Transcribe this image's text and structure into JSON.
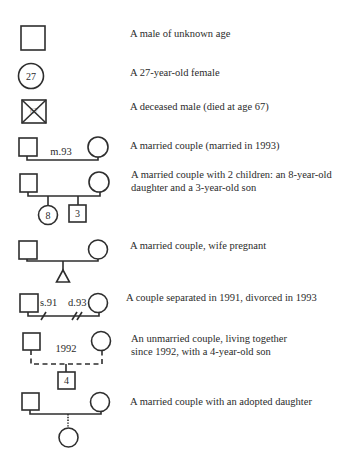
{
  "legend": [
    {
      "id": "male-unknown-age",
      "description": "A male of unknown age"
    },
    {
      "id": "female-27",
      "description": "A 27-year-old female",
      "symbol_label": "27"
    },
    {
      "id": "deceased-male",
      "description": "A deceased male (died at age 67)",
      "symbol_label": "67"
    },
    {
      "id": "married-couple",
      "description": "A married couple (married in 1993)",
      "line_label": "m.93"
    },
    {
      "id": "couple-two-children",
      "description": "A married couple with 2 children: an 8-year-old daughter and a 3-year-old son",
      "child_labels": [
        "8",
        "3"
      ]
    },
    {
      "id": "wife-pregnant",
      "description": "A married couple, wife pregnant"
    },
    {
      "id": "separated-divorced",
      "description": "A couple separated in 1991, divorced in 1993",
      "labels": [
        "s.91",
        "d.93"
      ]
    },
    {
      "id": "unmarried-couple",
      "description": "An unmarried couple, living together since 1992, with a 4-year-old son",
      "line_label": "1992",
      "child_label": "4"
    },
    {
      "id": "adopted-daughter",
      "description": "A married couple with an adopted daughter"
    }
  ],
  "colors": {
    "stroke": "#2e2e2e",
    "text": "#2b2b2b",
    "background": "#ffffff"
  }
}
